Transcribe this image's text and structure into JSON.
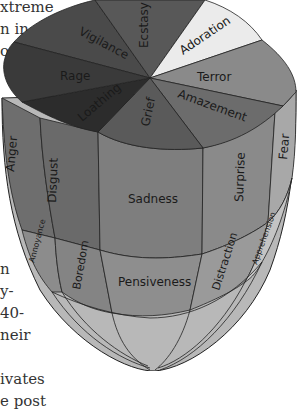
{
  "side_text_top": [
    "xtreme",
    "n in",
    "o"
  ],
  "side_text_bottom": [
    "n",
    "y-",
    "40-",
    "neir",
    "",
    "ivates",
    "e post"
  ],
  "diagram": {
    "top_sectors": [
      {
        "label": "Vigilance",
        "color": "#4a4a4a"
      },
      {
        "label": "Ecstasy",
        "color": "#5a5a5a"
      },
      {
        "label": "Adoration",
        "color": "#e8e8e8"
      },
      {
        "label": "Terror",
        "color": "#8a8a8a"
      },
      {
        "label": "Amazement",
        "color": "#6e6e6e"
      },
      {
        "label": "Grief",
        "color": "#5c5c5c"
      },
      {
        "label": "Loathing",
        "color": "#2e2e2e"
      },
      {
        "label": "Rage",
        "color": "#3c3c3c"
      }
    ],
    "ring1": [
      "Anger",
      "Disgust",
      "Sadness",
      "Surprise",
      "Fear"
    ],
    "ring2": [
      "Annoyance",
      "Boredom",
      "Pensiveness",
      "Distraction",
      "Apprehension"
    ]
  }
}
